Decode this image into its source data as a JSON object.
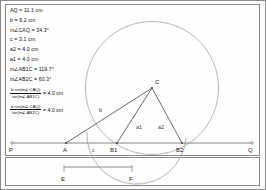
{
  "panels": {
    "main_label": "geometry-construction-panel",
    "measure_label": "segment-panel"
  },
  "measurements": [
    {
      "id": "AQ",
      "text": "AQ = 11.1 cm"
    },
    {
      "id": "b",
      "text": "b = 6.2 cm"
    },
    {
      "id": "angle-CAQ",
      "text": "m∠CAQ = 34.3°"
    },
    {
      "id": "c",
      "text": "c = 3.1 cm"
    },
    {
      "id": "a2",
      "text": "a2 = 4.0 cm"
    },
    {
      "id": "a1",
      "text": "a1 = 4.0 cm"
    },
    {
      "id": "angle-AB1C",
      "text": "m∠AB1C = 119.7°"
    },
    {
      "id": "angle-AB2C",
      "text": "m∠AB2C = 60.3°"
    }
  ],
  "formulas": [
    {
      "id": "law-of-sines-b1",
      "numerator": "b·sin(m∠CAQ)",
      "denominator": "sin(m∠AB1C)",
      "equals": "= 4.0 cm"
    },
    {
      "id": "law-of-sines-b2",
      "numerator": "b·sin(m∠CAQ)",
      "denominator": "sin(m∠AB2C)",
      "equals": "= 4.0 cm"
    }
  ],
  "diagram": {
    "points": {
      "P": "P",
      "A": "A",
      "B1": "B1",
      "B2": "B2",
      "Q": "Q",
      "C": "C"
    },
    "side_labels": {
      "b": "b",
      "c": "c",
      "a1": "a1",
      "a2": "a2"
    },
    "colors": {
      "line": "#6e6e6e",
      "circle": "#9a9a9a",
      "text": "#1a1a1a",
      "frame": "#8a8a8a"
    }
  },
  "segment": {
    "start_label": "E",
    "end_label": "F"
  }
}
